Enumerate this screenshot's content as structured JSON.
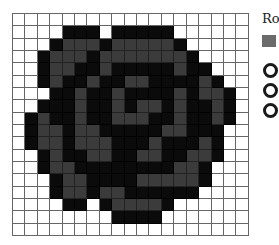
{
  "chart_data": {
    "type": "heatmap",
    "title": "",
    "columns": 19,
    "rows": 18,
    "value_meaning": {
      "0": "white (empty)",
      "1": "dark gray",
      "2": "black"
    },
    "colors": {
      "0": "#ffffff",
      "1": "#3b3b3b",
      "2": "#0b0b0b"
    },
    "grid": [
      [
        0,
        0,
        0,
        0,
        0,
        0,
        0,
        0,
        0,
        0,
        0,
        0,
        0,
        0,
        0,
        0,
        0,
        0,
        0
      ],
      [
        0,
        0,
        0,
        0,
        2,
        2,
        2,
        0,
        2,
        2,
        2,
        2,
        2,
        0,
        0,
        0,
        0,
        0,
        0
      ],
      [
        0,
        0,
        0,
        2,
        1,
        1,
        1,
        2,
        1,
        1,
        1,
        1,
        1,
        2,
        0,
        0,
        0,
        0,
        0
      ],
      [
        0,
        0,
        2,
        1,
        1,
        1,
        2,
        1,
        1,
        1,
        1,
        1,
        1,
        1,
        2,
        0,
        0,
        0,
        0
      ],
      [
        0,
        0,
        2,
        1,
        1,
        2,
        2,
        1,
        2,
        2,
        2,
        2,
        2,
        1,
        2,
        2,
        0,
        0,
        0
      ],
      [
        0,
        0,
        2,
        1,
        2,
        2,
        1,
        2,
        2,
        1,
        1,
        2,
        2,
        2,
        2,
        1,
        2,
        0,
        0
      ],
      [
        0,
        0,
        0,
        2,
        2,
        1,
        2,
        2,
        1,
        2,
        2,
        2,
        2,
        1,
        2,
        1,
        1,
        2,
        0
      ],
      [
        0,
        0,
        2,
        2,
        2,
        1,
        2,
        2,
        1,
        2,
        1,
        1,
        2,
        1,
        2,
        2,
        1,
        2,
        0
      ],
      [
        0,
        2,
        1,
        2,
        2,
        1,
        2,
        2,
        1,
        1,
        1,
        2,
        2,
        1,
        2,
        2,
        1,
        2,
        0
      ],
      [
        0,
        2,
        1,
        1,
        2,
        1,
        1,
        2,
        2,
        2,
        2,
        2,
        1,
        1,
        2,
        2,
        2,
        0,
        0
      ],
      [
        0,
        2,
        1,
        1,
        2,
        1,
        1,
        1,
        2,
        2,
        2,
        1,
        2,
        2,
        2,
        1,
        2,
        0,
        0
      ],
      [
        0,
        0,
        2,
        1,
        2,
        2,
        1,
        1,
        2,
        2,
        1,
        1,
        2,
        2,
        1,
        1,
        2,
        0,
        0
      ],
      [
        0,
        0,
        2,
        1,
        1,
        2,
        2,
        2,
        2,
        2,
        2,
        2,
        2,
        1,
        1,
        2,
        0,
        0,
        0
      ],
      [
        0,
        0,
        0,
        2,
        1,
        1,
        2,
        2,
        2,
        2,
        1,
        1,
        1,
        1,
        1,
        2,
        0,
        0,
        0
      ],
      [
        0,
        0,
        0,
        2,
        1,
        1,
        2,
        1,
        1,
        2,
        2,
        2,
        2,
        2,
        2,
        0,
        0,
        0,
        0
      ],
      [
        0,
        0,
        0,
        0,
        2,
        2,
        0,
        2,
        1,
        1,
        1,
        1,
        2,
        0,
        0,
        0,
        0,
        0,
        0
      ],
      [
        0,
        0,
        0,
        0,
        0,
        0,
        0,
        0,
        2,
        2,
        2,
        2,
        0,
        0,
        0,
        0,
        0,
        0,
        0
      ],
      [
        0,
        0,
        0,
        0,
        0,
        0,
        0,
        0,
        0,
        0,
        0,
        0,
        0,
        0,
        0,
        0,
        0,
        0,
        0
      ]
    ],
    "legend": {
      "title": "Ro",
      "items": [
        {
          "symbol": "gray-square",
          "color": "#6b6b6b"
        },
        {
          "symbol": "ring",
          "color": "#1a1a1a"
        },
        {
          "symbol": "ring",
          "color": "#1a1a1a"
        },
        {
          "symbol": "ring",
          "color": "#1a1a1a"
        }
      ]
    }
  }
}
